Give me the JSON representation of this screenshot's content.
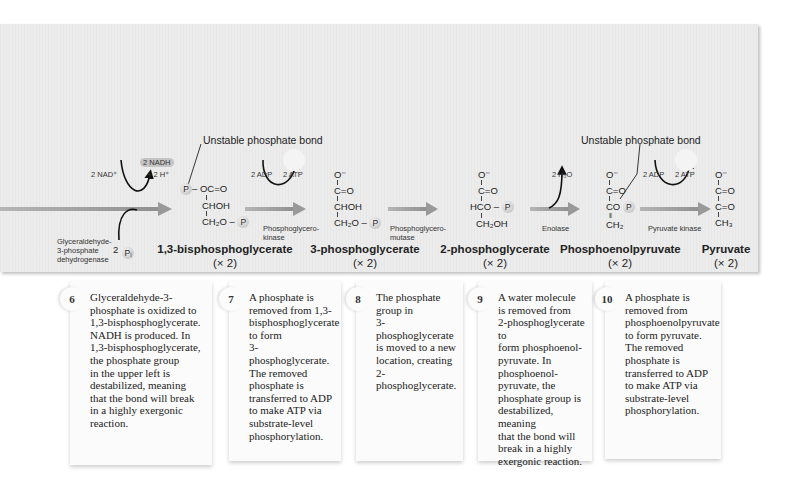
{
  "diagram": {
    "unstable_bond_label": "Unstable phosphate bond",
    "reactions": [
      {
        "step": 6,
        "enzyme": "Glyceraldehyde-\n3-phosphate\ndehydrogenase",
        "inputs": [
          "2 NAD⁺",
          "2 Pᵢ"
        ],
        "outputs": [
          "2 NADH",
          "+ 2 H⁺"
        ]
      },
      {
        "step": 7,
        "enzyme": "Phosphoglycero-\nkinase",
        "inputs": [
          "2 ADP"
        ],
        "outputs": [
          "2 ATP"
        ]
      },
      {
        "step": 8,
        "enzyme": "Phosphoglycero-\nmutase",
        "inputs": [],
        "outputs": []
      },
      {
        "step": 9,
        "enzyme": "Enolase",
        "inputs": [],
        "outputs": [
          "2 H₂O"
        ]
      },
      {
        "step": 10,
        "enzyme": "Pyruvate kinase",
        "inputs": [
          "2 ADP"
        ],
        "outputs": [
          "2 ATP"
        ]
      }
    ],
    "molecules": [
      {
        "name": "1,3-bisphosphoglycerate",
        "count": "(× 2)",
        "structure": [
          "P – OC=O",
          "CHOH",
          "CH₂O – P"
        ]
      },
      {
        "name": "3-phosphoglycerate",
        "count": "(× 2)",
        "structure": [
          "O⁻",
          "C=O",
          "CHOH",
          "CH₂O – P"
        ]
      },
      {
        "name": "2-phosphoglycerate",
        "count": "(× 2)",
        "structure": [
          "O⁻",
          "C=O",
          "HCO – P",
          "CH₂OH"
        ]
      },
      {
        "name": "Phosphoenolpyruvate",
        "count": "(× 2)",
        "structure": [
          "O⁻",
          "C=O",
          "CO – P",
          "CH₂"
        ]
      },
      {
        "name": "Pyruvate",
        "count": "(× 2)",
        "structure": [
          "O⁻",
          "C=O",
          "C=O",
          "CH₃"
        ]
      }
    ],
    "chem": {
      "nad": "2 NAD⁺",
      "nadh": "2 NADH",
      "h": "+ 2 H⁺",
      "pi_coef": "2",
      "pi": "Pᵢ",
      "adp": "2 ADP",
      "atp": "2 ATP",
      "h2o": "2 H₂O",
      "p": "P",
      "o_minus": "O⁻",
      "co": "C=O",
      "chohh": "CHOH",
      "ch2o": "CH₂O –",
      "hco": "HCO –",
      "ch2oh": "CH₂OH",
      "co_enol": "CO",
      "ch2": "CH₂",
      "ch3": "CH₃",
      "oc": "– OC=O"
    }
  },
  "steps": [
    {
      "number": "6",
      "text": "Glyceraldehyde-3-\nphosphate is oxidized to\n1,3-bisphosphoglycerate.\nNADH is produced. In\n1,3-bisphosphoglycerate,\nthe phosphate group\nin the upper left is\ndestabilized, meaning\nthat the bond will break\nin a highly exergonic\nreaction."
    },
    {
      "number": "7",
      "text": "A phosphate is\nremoved from 1,3-\nbisphosphoglycerate\nto form\n3-phosphoglycerate.\nThe removed\nphosphate is\ntransferred to ADP\nto make ATP via\nsubstrate-level\nphosphorylation."
    },
    {
      "number": "8",
      "text": "The phosphate\ngroup in\n3-phosphoglycerate\nis moved to a new\nlocation, creating\n2-phosphoglycerate."
    },
    {
      "number": "9",
      "text": "A water molecule\nis removed from\n2-phosphoglycerate to\nform phosphoenol-\npyruvate. In\nphosphoenol-\npyruvate, the\nphosphate group is\ndestabilized, meaning\nthat the bond will\nbreak in a highly\nexergonic reaction."
    },
    {
      "number": "10",
      "text": "A phosphate is\nremoved from\nphosphoenolpyruvate\nto form pyruvate.\nThe removed\nphosphate is\ntransferred to ADP\nto make ATP via\nsubstrate-level\nphosphorylation."
    }
  ]
}
